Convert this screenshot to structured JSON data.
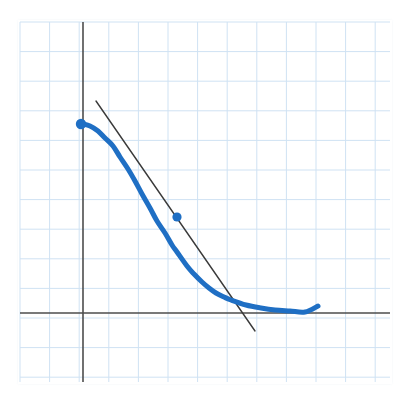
{
  "figure": {
    "title": "",
    "background_color": "#ffffff",
    "grid_paper_color": "#cfe2f3",
    "axis_color": "#4d4d4d",
    "curve_color": "#1f6fc4",
    "tangent_color": "#3a3a3a",
    "point_color": "#1f6fc4"
  },
  "grid": {
    "left": 20,
    "top": 22,
    "right": 390,
    "bottom": 382,
    "cell_size": 29.6,
    "columns": 12,
    "rows": 12,
    "line_color": "#cfe2f3",
    "line_width": 1.0,
    "visible": true
  },
  "axes": {
    "y_axis_x": 83,
    "x_axis_y": 313,
    "y_axis_top": 22,
    "y_axis_bottom": 382,
    "x_axis_left": 20,
    "x_axis_right": 390,
    "color": "#4d4d4d",
    "line_width": 1.6,
    "x_label": "",
    "y_label": "",
    "tick_labels": []
  },
  "chart_data": {
    "type": "line",
    "title": "",
    "subtitle": "",
    "xlabel": "",
    "ylabel": "",
    "grid": true,
    "legend": null,
    "legend_position": "none",
    "xlim": [
      -2.13,
      10.37
    ],
    "ylim": [
      -2.33,
      9.83
    ],
    "series": [
      {
        "name": "curve",
        "type": "line",
        "color": "#1f6fc4",
        "line_width": 5,
        "x": [
          0.0,
          0.25,
          0.5,
          0.75,
          1.0,
          1.25,
          1.5,
          1.75,
          2.0,
          2.25,
          2.5,
          2.75,
          3.0,
          3.17,
          3.5,
          3.75,
          4.0,
          4.25,
          4.5,
          4.75,
          5.0,
          5.5,
          6.0,
          6.5,
          7.0,
          7.5,
          7.94
        ],
        "y": [
          6.38,
          6.3,
          6.15,
          5.93,
          5.64,
          5.3,
          4.91,
          4.5,
          4.07,
          3.63,
          3.2,
          2.79,
          2.4,
          2.18,
          1.74,
          1.46,
          1.22,
          1.02,
          0.86,
          0.73,
          0.63,
          0.48,
          0.38,
          0.32,
          0.28,
          0.26,
          0.24
        ],
        "pixel_points": [
          [
            83,
            124
          ],
          [
            90,
            126
          ],
          [
            98,
            131
          ],
          [
            105,
            138
          ],
          [
            113,
            146
          ],
          [
            120,
            157
          ],
          [
            128,
            169
          ],
          [
            135,
            181
          ],
          [
            142,
            194
          ],
          [
            150,
            208
          ],
          [
            157,
            221
          ],
          [
            165,
            233
          ],
          [
            172,
            245
          ],
          [
            177,
            252
          ],
          [
            187,
            266
          ],
          [
            194,
            274
          ],
          [
            202,
            282
          ],
          [
            209,
            288
          ],
          [
            216,
            293
          ],
          [
            224,
            297
          ],
          [
            231,
            300
          ],
          [
            246,
            305
          ],
          [
            261,
            308
          ],
          [
            275,
            310
          ],
          [
            290,
            311
          ],
          [
            305,
            312
          ],
          [
            318,
            306
          ]
        ]
      },
      {
        "name": "tangent-line",
        "type": "line",
        "color": "#3a3a3a",
        "line_width": 1.4,
        "x_pixel_start": 96,
        "y_pixel_start": 101,
        "x_pixel_end": 255,
        "y_pixel_end": 331,
        "slope_pixel": -1.447,
        "description": "Straight tangent line touching the curve at the interior marked point."
      }
    ],
    "points": [
      {
        "name": "curve-start-point",
        "label": "",
        "x_pixel": 81,
        "y_pixel": 124,
        "radius": 5.2,
        "color": "#1f6fc4",
        "on_axis": "y-axis intercept"
      },
      {
        "name": "tangency-point",
        "label": "",
        "x_pixel": 177,
        "y_pixel": 217,
        "radius": 4.6,
        "color": "#1f6fc4",
        "on_axis": "point of tangency"
      }
    ]
  }
}
